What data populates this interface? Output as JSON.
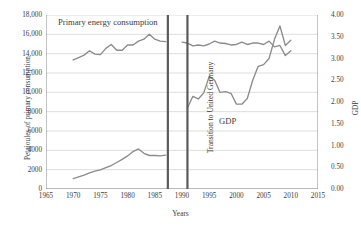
{
  "chart_data": {
    "type": "line",
    "title": "",
    "xlabel": "Years",
    "ylabel_left": "Petajoules of primary consumption",
    "ylabel_right": "GDP",
    "xlim": [
      1965,
      2015
    ],
    "ylim_left": [
      0,
      18000
    ],
    "ylim_right": [
      0.0,
      4.0
    ],
    "grid": true,
    "legend": "none",
    "xticks": [
      "1965",
      "1970",
      "1975",
      "1980",
      "1985",
      "1990",
      "1995",
      "2000",
      "2005",
      "2010",
      "2015"
    ],
    "yticks_left": [
      "18,000",
      "16,000",
      "14,000",
      "12,000",
      "10,000",
      "8000",
      "6000",
      "4000",
      "2000",
      "0"
    ],
    "yticks_right": [
      "4.00",
      "3.50",
      "3.00",
      "2.50",
      "2.00",
      "1.50",
      "1.00",
      "0.50",
      "0.00"
    ],
    "annotations": [
      {
        "name": "primary-energy-label",
        "text": "Primary energy consumption"
      },
      {
        "name": "gdp-label",
        "text": "GDP"
      },
      {
        "name": "transition-label",
        "text": "Transition to United Germany"
      }
    ],
    "transition_band": {
      "start_year": 1987.4,
      "end_year": 1991.0
    },
    "series": [
      {
        "name": "Primary energy consumption (West, pre-unification)",
        "axis": "left",
        "color": "#8c8c8c",
        "x": [
          1970,
          1971,
          1972,
          1973,
          1974,
          1975,
          1976,
          1977,
          1978,
          1979,
          1980,
          1981,
          1982,
          1983,
          1984,
          1985,
          1986,
          1987
        ],
        "y": [
          13350,
          13600,
          13850,
          14300,
          13950,
          13900,
          14550,
          14950,
          14350,
          14350,
          14900,
          14900,
          15300,
          15500,
          16000,
          15500,
          15300,
          15250
        ]
      },
      {
        "name": "Primary energy consumption (United Germany)",
        "axis": "left",
        "color": "#8c8c8c",
        "x": [
          1990,
          1991,
          1992,
          1993,
          1994,
          1995,
          1996,
          1997,
          1998,
          1999,
          2000,
          2001,
          2002,
          2003,
          2004,
          2005,
          2006,
          2007,
          2008,
          2009,
          2010
        ],
        "y": [
          15200,
          15100,
          14800,
          14900,
          14800,
          15000,
          15300,
          15100,
          15050,
          14900,
          14950,
          15200,
          14950,
          15100,
          15100,
          14950,
          15300,
          14700,
          14850,
          13800,
          14300
        ]
      },
      {
        "name": "GDP (West, pre-unification)",
        "axis": "right",
        "color": "#8c8c8c",
        "x": [
          1970,
          1971,
          1972,
          1973,
          1974,
          1975,
          1976,
          1977,
          1978,
          1979,
          1980,
          1981,
          1982,
          1983,
          1984,
          1985,
          1986,
          1987
        ],
        "y": [
          0.24,
          0.28,
          0.32,
          0.37,
          0.41,
          0.44,
          0.49,
          0.54,
          0.61,
          0.68,
          0.76,
          0.86,
          0.92,
          0.82,
          0.77,
          0.77,
          0.76,
          0.78
        ]
      },
      {
        "name": "GDP (United Germany)",
        "axis": "right",
        "color": "#8c8c8c",
        "x": [
          1991,
          1992,
          1993,
          1994,
          1995,
          1996,
          1997,
          1998,
          1999,
          2000,
          2001,
          2002,
          2003,
          2004,
          2005,
          2006,
          2007,
          2008,
          2009,
          2010
        ],
        "y": [
          1.86,
          2.13,
          2.07,
          2.21,
          2.59,
          2.5,
          2.22,
          2.24,
          2.2,
          1.95,
          1.95,
          2.08,
          2.5,
          2.82,
          2.86,
          3.0,
          3.44,
          3.75,
          3.3,
          3.42
        ]
      }
    ]
  },
  "axes": {
    "left_title": "Petajoules of primary consumption",
    "right_title": "GDP",
    "x_title": "Years"
  },
  "labels": {
    "primary_energy": "Primary energy consumption",
    "gdp": "GDP",
    "transition": "Transition to United Germany"
  },
  "colors": {
    "line": "#8c8c8c",
    "grid": "#d6d6d6",
    "axis": "#7a7a7a",
    "divider": "#5a5a5a",
    "text": "#3b3b3b"
  }
}
